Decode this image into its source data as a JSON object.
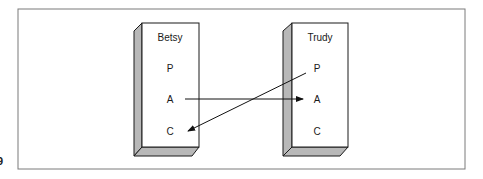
{
  "figure": {
    "mark": "9",
    "frame_color": "#7a7a7a",
    "box_edge_color": "#1a1a1a",
    "box_side_color": "#b8b8b8",
    "arrow_color": "#111111"
  },
  "boxes": [
    {
      "name": "Betsy",
      "slots": [
        "P",
        "A",
        "C"
      ]
    },
    {
      "name": "Trudy",
      "slots": [
        "P",
        "A",
        "C"
      ]
    }
  ],
  "arrows": [
    {
      "from": "Betsy.A",
      "to": "Trudy.A"
    },
    {
      "from": "Trudy.P",
      "to": "Betsy.C"
    }
  ]
}
